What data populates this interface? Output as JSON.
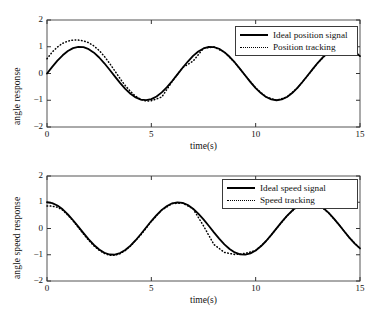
{
  "figure": {
    "background": "#ffffff",
    "line_color": "#000000"
  },
  "chart_data": [
    {
      "type": "line",
      "id": "angle-position-response",
      "title": "",
      "xlabel": "time(s)",
      "ylabel": "angle response",
      "xlim": [
        0,
        15
      ],
      "ylim": [
        -2,
        2
      ],
      "xticks": [
        0,
        5,
        10,
        15
      ],
      "xtick_labels": [
        "0",
        "5",
        "10",
        "15"
      ],
      "yticks": [
        -2,
        -1,
        0,
        1,
        2
      ],
      "ytick_labels": [
        "-2",
        "-1",
        "0",
        "1",
        "2"
      ],
      "grid": false,
      "legend_position": "top-right",
      "series": [
        {
          "name": "Ideal position signal",
          "style": "solid",
          "color": "#000000",
          "width": 1.8,
          "formula": "sin(t)",
          "x": [
            0,
            0.25,
            0.5,
            0.75,
            1,
            1.25,
            1.5,
            1.75,
            2,
            2.25,
            2.5,
            2.75,
            3,
            3.25,
            3.5,
            3.75,
            4,
            4.25,
            4.5,
            4.75,
            5,
            5.25,
            5.5,
            5.75,
            6,
            6.25,
            6.5,
            6.75,
            7,
            7.25,
            7.5,
            7.75,
            8,
            8.25,
            8.5,
            8.75,
            9,
            9.25,
            9.5,
            9.75,
            10,
            10.25,
            10.5,
            10.75,
            11,
            11.25,
            11.5,
            11.75,
            12,
            12.25,
            12.5,
            12.75,
            13,
            13.25,
            13.5,
            13.75,
            14,
            14.25,
            14.5,
            14.75,
            15
          ],
          "y": [
            0,
            0.247,
            0.479,
            0.682,
            0.841,
            0.949,
            0.997,
            0.984,
            0.909,
            0.778,
            0.599,
            0.382,
            0.141,
            -0.108,
            -0.351,
            -0.572,
            -0.757,
            -0.895,
            -0.978,
            -0.999,
            -0.959,
            -0.858,
            -0.706,
            -0.512,
            -0.279,
            -0.033,
            0.215,
            0.447,
            0.657,
            0.821,
            0.938,
            0.993,
            0.989,
            0.925,
            0.798,
            0.625,
            0.412,
            0.172,
            -0.075,
            -0.322,
            -0.544,
            -0.734,
            -0.879,
            -0.969,
            -1.0,
            -0.969,
            -0.878,
            -0.732,
            -0.537,
            -0.309,
            -0.066,
            0.182,
            0.42,
            0.633,
            0.804,
            0.928,
            0.991,
            0.994,
            0.935,
            0.818,
            0.65
          ]
        },
        {
          "name": "Position tracking",
          "style": "dotted",
          "color": "#000000",
          "width": 1.5,
          "note": "overshoots early then converges to ideal",
          "x": [
            0,
            0.25,
            0.5,
            0.75,
            1,
            1.25,
            1.5,
            1.75,
            2,
            2.25,
            2.5,
            2.75,
            3,
            3.25,
            3.5,
            3.75,
            4,
            4.25,
            4.5,
            4.75,
            5,
            5.5,
            6,
            6.5,
            7,
            7.5,
            8,
            8.5,
            9,
            9.5,
            10,
            10.5,
            11,
            11.5,
            12,
            12.5,
            13,
            13.5,
            14,
            14.5,
            15
          ],
          "y": [
            0.55,
            0.8,
            0.99,
            1.13,
            1.21,
            1.25,
            1.25,
            1.22,
            1.15,
            1.03,
            0.86,
            0.64,
            0.38,
            0.1,
            -0.19,
            -0.45,
            -0.67,
            -0.85,
            -0.97,
            -1.03,
            -1.02,
            -0.88,
            -0.3,
            0.22,
            0.46,
            0.94,
            0.99,
            0.8,
            0.41,
            -0.07,
            -0.54,
            -0.88,
            -1.0,
            -0.88,
            -0.54,
            -0.07,
            0.42,
            0.8,
            0.99,
            0.93,
            0.65
          ]
        }
      ]
    },
    {
      "type": "line",
      "id": "angle-speed-response",
      "title": "",
      "xlabel": "time(s)",
      "ylabel": "angle speed response",
      "xlim": [
        0,
        15
      ],
      "ylim": [
        -2,
        2
      ],
      "xticks": [
        0,
        5,
        10,
        15
      ],
      "xtick_labels": [
        "0",
        "5",
        "10",
        "15"
      ],
      "yticks": [
        -2,
        -1,
        0,
        1,
        2
      ],
      "ytick_labels": [
        "-2",
        "-1",
        "0",
        "1",
        "2"
      ],
      "grid": false,
      "legend_position": "top-right",
      "series": [
        {
          "name": "Ideal speed signal",
          "style": "solid",
          "color": "#000000",
          "width": 1.8,
          "formula": "cos(t)",
          "x": [
            0,
            0.25,
            0.5,
            0.75,
            1,
            1.25,
            1.5,
            1.75,
            2,
            2.25,
            2.5,
            2.75,
            3,
            3.25,
            3.5,
            3.75,
            4,
            4.25,
            4.5,
            4.75,
            5,
            5.25,
            5.5,
            5.75,
            6,
            6.25,
            6.5,
            6.75,
            7,
            7.25,
            7.5,
            7.75,
            8,
            8.25,
            8.5,
            8.75,
            9,
            9.25,
            9.5,
            9.75,
            10,
            10.25,
            10.5,
            10.75,
            11,
            11.25,
            11.5,
            11.75,
            12,
            12.25,
            12.5,
            12.75,
            13,
            13.25,
            13.5,
            13.75,
            14,
            14.25,
            14.5,
            14.75,
            15
          ],
          "y": [
            1,
            0.969,
            0.878,
            0.732,
            0.54,
            0.315,
            0.071,
            -0.178,
            -0.416,
            -0.628,
            -0.801,
            -0.924,
            -0.99,
            -0.994,
            -0.936,
            -0.82,
            -0.654,
            -0.447,
            -0.211,
            0.038,
            0.284,
            0.512,
            0.709,
            0.859,
            0.96,
            0.999,
            0.977,
            0.895,
            0.754,
            0.568,
            0.347,
            0.104,
            -0.146,
            -0.385,
            -0.602,
            -0.781,
            -0.911,
            -0.985,
            -0.997,
            -0.947,
            -0.839,
            -0.678,
            -0.476,
            -0.245,
            0.004,
            0.252,
            0.483,
            0.684,
            0.844,
            0.951,
            0.995,
            0.979,
            0.907,
            0.774,
            0.593,
            0.375,
            0.137,
            -0.112,
            -0.355,
            -0.575,
            -0.76
          ]
        },
        {
          "name": "Speed tracking",
          "style": "dotted",
          "color": "#000000",
          "width": 1.5,
          "note": "starts slightly below ideal then converges",
          "x": [
            0,
            0.25,
            0.5,
            0.75,
            1,
            1.25,
            1.5,
            1.75,
            2,
            2.25,
            2.5,
            2.75,
            3,
            3.25,
            3.5,
            3.75,
            4,
            4.5,
            5,
            5.5,
            6,
            6.5,
            7,
            7.5,
            8,
            8.5,
            9,
            9.5,
            10,
            10.5,
            11,
            11.5,
            12,
            12.5,
            13,
            13.5,
            14,
            14.5,
            15
          ],
          "y": [
            0.86,
            0.85,
            0.81,
            0.7,
            0.51,
            0.29,
            0.04,
            -0.21,
            -0.45,
            -0.66,
            -0.83,
            -0.95,
            -1.02,
            -1.02,
            -0.96,
            -0.84,
            -0.67,
            -0.24,
            0.27,
            0.7,
            0.95,
            0.97,
            0.75,
            0.1,
            -0.61,
            -0.91,
            -0.99,
            -0.95,
            -0.84,
            -0.48,
            0.0,
            0.48,
            0.84,
            0.99,
            0.91,
            0.59,
            0.14,
            -0.36,
            -0.76
          ]
        }
      ]
    }
  ],
  "panels": [
    {
      "id": "position",
      "y_axis_title": "angle response",
      "x_axis_title": "time(s)",
      "y_tick_labels": [
        "2",
        "1",
        "0",
        "-1",
        "-2"
      ],
      "x_tick_labels": [
        "0",
        "5",
        "10",
        "15"
      ],
      "legend": [
        {
          "label": "Ideal position signal",
          "style": "solid"
        },
        {
          "label": "Position tracking",
          "style": "dotted"
        }
      ]
    },
    {
      "id": "speed",
      "y_axis_title": "angle speed response",
      "x_axis_title": "time(s)",
      "y_tick_labels": [
        "2",
        "1",
        "0",
        "-1",
        "-2"
      ],
      "x_tick_labels": [
        "0",
        "5",
        "10",
        "15"
      ],
      "legend": [
        {
          "label": "Ideal speed signal",
          "style": "solid"
        },
        {
          "label": "Speed tracking",
          "style": "dotted"
        }
      ]
    }
  ]
}
